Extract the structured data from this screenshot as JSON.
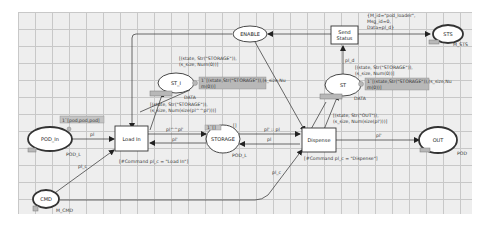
{
  "diagram": {
    "type": "coloured-petri-net",
    "colors": {
      "background": "#ffffff",
      "grid": "#eeeeee",
      "grid_line": "#c8c8c8",
      "stroke": "#333333",
      "node_fill": "#ffffff",
      "marking_fill": "#b8b8b8"
    },
    "places": {
      "enable": {
        "name": "ENABLE"
      },
      "st_i": {
        "name": "ST_I",
        "colorset": "DATA",
        "marking": "1`[(state,Str(\"STORAGE\")),(s_size,Num(0))]",
        "marking_l1": "1`[(state,Str(\"STORAGE\")),(s_size,Nu",
        "marking_l2": "m(0))]"
      },
      "st": {
        "name": "ST",
        "colorset": "DATA",
        "marking_l1": "1`[(state,Str(\"STORAGE\")),(s_size,Nu",
        "marking_l2": "m(0))]"
      },
      "sts": {
        "name": "STS",
        "colorset": "M_STS"
      },
      "pod_in": {
        "name": "POD_In",
        "colorset": "POD_L",
        "marking": "1`[pod,pod,pod]"
      },
      "storage": {
        "name": "STORAGE",
        "colorset": "POD_L",
        "initial": "[]",
        "marking": "1`[]"
      },
      "out": {
        "name": "OUT",
        "colorset": "POD"
      },
      "cmd": {
        "name": "CMD",
        "colorset": "M_CMD"
      }
    },
    "transitions": {
      "send_status": {
        "line1": "Send",
        "line2": "Status"
      },
      "load_in": {
        "name": "Load In",
        "guard": "[#Command pl_c = \"Load In\"]"
      },
      "dispense": {
        "name": "Dispense",
        "guard": "[#Command pl_c = \"Dispense\"]"
      }
    },
    "arcs": {
      "st_i_to_load": {
        "l1": "[(state, Str(\"STORAGE\")),",
        "l2": "(s_size, Num(0))]"
      },
      "load_to_st_i": {
        "l1": "[(state, Str(\"STORAGE\")),",
        "l2": "(s_size, Num(size(pl^^pl')))]"
      },
      "st_to_dispense": {
        "l1": "[(state, Str(\"STORAGE\")),",
        "l2": "(s_size, Num(0))]"
      },
      "dispense_to_st": {
        "l1": "[(state, Str(\"OUT\")),",
        "l2": "(s_size, Num(size(pl')))]"
      },
      "st_to_send": "pl_d",
      "send_to_sts": {
        "l1": "{M_id=\"pod_loader\",",
        "l2": "Msg_id=0,",
        "l3": "Data=pl_d}"
      },
      "pod_in_to_load": "pl",
      "load_to_storage": "pl^^pl'",
      "storage_to_load": "pl'",
      "storage_to_dispense": "pl' :: pl",
      "dispense_to_storage": "pl",
      "dispense_to_out": "pl'",
      "cmd_to_load": "pl_c",
      "cmd_to_dispense": "pl_c"
    }
  }
}
